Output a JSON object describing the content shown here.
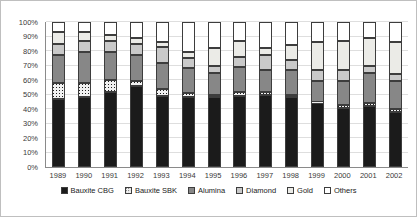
{
  "chart_data": {
    "type": "bar",
    "variant": "stacked-100-percent",
    "title": "",
    "xlabel": "",
    "ylabel": "",
    "ylim": [
      0,
      100
    ],
    "grid": true,
    "legend_position": "bottom",
    "y_ticks": [
      "0%",
      "10%",
      "20%",
      "30%",
      "40%",
      "50%",
      "60%",
      "70%",
      "80%",
      "90%",
      "100%"
    ],
    "categories": [
      "1989",
      "1990",
      "1991",
      "1992",
      "1993",
      "1994",
      "1995",
      "1996",
      "1997",
      "1998",
      "1999",
      "2000",
      "2001",
      "2002"
    ],
    "series": [
      {
        "name": "Bauxite CBG",
        "color": "#1b1b1b",
        "pattern": "solid",
        "values": [
          47,
          48,
          52,
          56,
          49,
          48,
          48,
          49,
          50,
          48,
          44,
          41,
          42,
          38
        ]
      },
      {
        "name": "Bauxite SBK",
        "color": "#f1f1f1",
        "pattern": "dots",
        "values": [
          11,
          10,
          8,
          3,
          5,
          3,
          2,
          3,
          2,
          2,
          1,
          2,
          2,
          2
        ]
      },
      {
        "name": "Alumina",
        "color": "#878787",
        "pattern": "solid",
        "values": [
          19,
          21,
          19,
          18,
          18,
          17,
          15,
          17,
          15,
          17,
          14,
          16,
          21,
          19
        ]
      },
      {
        "name": "Diamond",
        "color": "#c9c9c9",
        "pattern": "solid",
        "values": [
          8,
          8,
          8,
          8,
          11,
          7,
          5,
          7,
          10,
          7,
          8,
          8,
          5,
          5
        ]
      },
      {
        "name": "Gold",
        "color": "#ebebe7",
        "pattern": "solid",
        "values": [
          8,
          6,
          4,
          4,
          3,
          4,
          12,
          11,
          5,
          10,
          19,
          20,
          19,
          22
        ]
      },
      {
        "name": "Others",
        "color": "#ffffff",
        "pattern": "solid",
        "values": [
          7,
          7,
          9,
          11,
          14,
          21,
          18,
          13,
          18,
          16,
          14,
          13,
          11,
          14
        ]
      }
    ]
  },
  "style": {
    "gridline_color": "#dedede",
    "axis_line_color": "#8a8a8a",
    "segment_border_color": "#3d3d3d",
    "tick_label_color": "#3a3a3a",
    "legend_text_color": "#1a1a1a",
    "background_color": "#ffffff",
    "frame_border_color": "#bfbfbf"
  }
}
